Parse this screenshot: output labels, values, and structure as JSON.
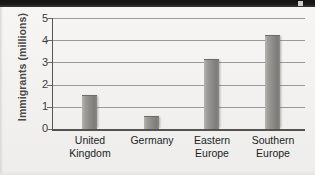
{
  "chart_data": {
    "type": "bar",
    "title": "",
    "subtitle": "",
    "xlabel": "",
    "ylabel": "Immigrants (millions)",
    "categories": [
      "United Kingdom",
      "Germany",
      "Eastern Europe",
      "Southern Europe"
    ],
    "category_lines": [
      [
        "United",
        "Kingdom"
      ],
      [
        "Germany",
        ""
      ],
      [
        "Eastern",
        "Europe"
      ],
      [
        "Southern",
        "Europe"
      ]
    ],
    "values": [
      1.55,
      0.6,
      3.15,
      4.25
    ],
    "ylim": [
      0,
      5
    ],
    "ytick_labels": [
      "0",
      "1",
      "2",
      "3",
      "4",
      "5"
    ],
    "ytick_values": [
      0,
      1,
      2,
      3,
      4,
      5
    ],
    "grid": true,
    "grid_axis": "y",
    "legend": false,
    "legend_position": "none",
    "bar_color": "#8d8b88",
    "grid_color": "#9c9a97",
    "axis_color": "#55534f",
    "label_color": "#201f1e",
    "ylabel_color": "#4b4a48",
    "background_color": "#f4f3f1"
  }
}
